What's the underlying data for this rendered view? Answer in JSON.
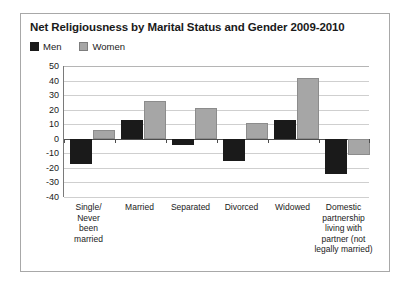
{
  "chart_data": {
    "type": "bar",
    "title": "Net Religiousness by Marital Status and Gender 2009-2010",
    "xlabel": "",
    "ylabel": "",
    "ylim": [
      -40,
      50
    ],
    "ytick_step": 10,
    "yticks": [
      50,
      40,
      30,
      20,
      10,
      0,
      -10,
      -20,
      -30,
      -40
    ],
    "grid": true,
    "legend_position": "top-left",
    "categories": [
      "Single/ Never been married",
      "Married",
      "Separated",
      "Divorced",
      "Widowed",
      "Domestic partnership living with partner (not legally married)"
    ],
    "category_lines": [
      [
        "Single/",
        "Never",
        "been",
        "married"
      ],
      [
        "Married"
      ],
      [
        "Separated"
      ],
      [
        "Divorced"
      ],
      [
        "Widowed"
      ],
      [
        "Domestic",
        "partnership",
        "living with",
        "partner (not",
        "legally married)"
      ]
    ],
    "series": [
      {
        "name": "Men",
        "color": "#1a1a1a",
        "values": [
          -17,
          13,
          -4,
          -15,
          13,
          -24
        ]
      },
      {
        "name": "Women",
        "color": "#a6a6a6",
        "values": [
          6,
          26,
          21,
          11,
          42,
          -11
        ]
      }
    ]
  },
  "legend": {
    "items": [
      {
        "label": "Men",
        "swatch": "men-swatch"
      },
      {
        "label": "Women",
        "swatch": "women-swatch"
      }
    ]
  }
}
